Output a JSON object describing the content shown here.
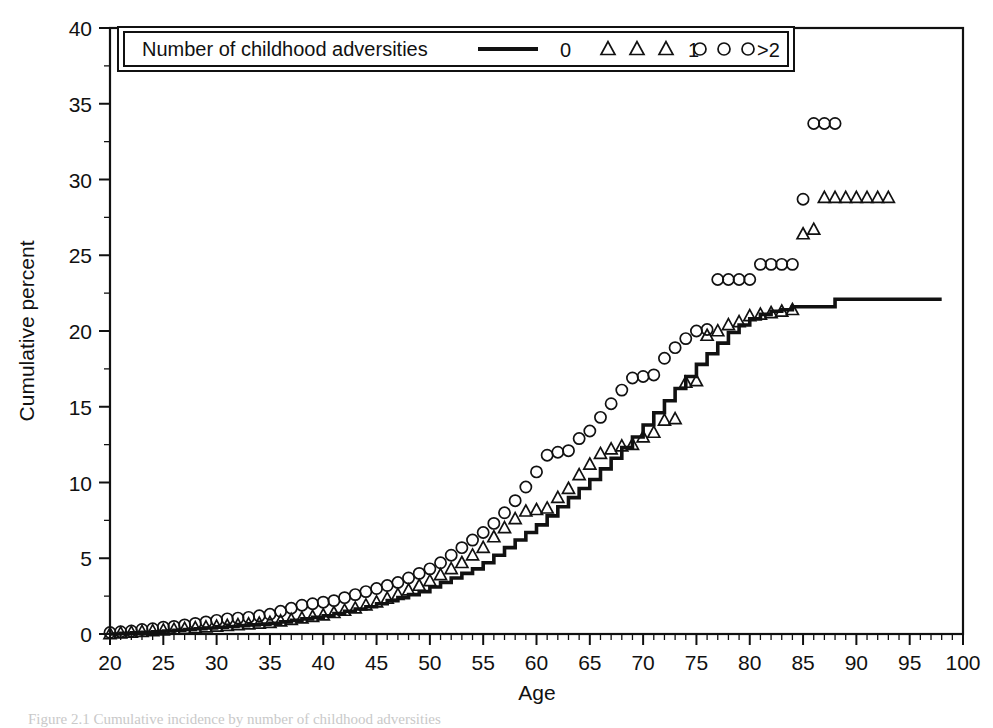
{
  "figure": {
    "caption_partial": "Figure 2.1  Cumulative incidence by number of childhood adversities"
  },
  "legend": {
    "title": "Number of childhood adversities",
    "entries": [
      {
        "label": "0",
        "marker": "line-icon"
      },
      {
        "label": "1",
        "marker": "triangle-icon"
      },
      {
        "label": ">2",
        "marker": "circle-icon"
      }
    ]
  },
  "chart_data": {
    "type": "line",
    "title": "",
    "subtitle": "",
    "xlabel": "Age",
    "ylabel": "Cumulative percent",
    "xlim": [
      20,
      100
    ],
    "ylim": [
      0,
      40
    ],
    "xticks": [
      20,
      25,
      30,
      35,
      40,
      45,
      50,
      55,
      60,
      65,
      70,
      75,
      80,
      85,
      90,
      95,
      100
    ],
    "yticks": [
      0,
      5,
      10,
      15,
      20,
      25,
      30,
      35,
      40
    ],
    "x_minor_step": 1,
    "y_minor_step": 2.5,
    "grid": false,
    "legend_position": "top-inside",
    "series": [
      {
        "name": "0",
        "legend_label": "0",
        "style": "step",
        "marker": "none",
        "x": [
          20,
          21,
          22,
          23,
          24,
          25,
          26,
          27,
          28,
          29,
          30,
          31,
          32,
          33,
          34,
          35,
          36,
          37,
          38,
          39,
          40,
          41,
          42,
          43,
          44,
          45,
          46,
          47,
          48,
          49,
          50,
          51,
          52,
          53,
          54,
          55,
          56,
          57,
          58,
          59,
          60,
          61,
          62,
          63,
          64,
          65,
          66,
          67,
          68,
          69,
          70,
          71,
          72,
          73,
          74,
          75,
          76,
          77,
          78,
          79,
          80,
          81,
          82,
          83,
          84,
          85,
          86,
          87,
          88,
          89,
          90,
          91,
          92,
          93,
          94,
          95,
          96,
          97,
          98
        ],
        "y": [
          0.0,
          0.05,
          0.08,
          0.12,
          0.15,
          0.2,
          0.25,
          0.3,
          0.35,
          0.4,
          0.45,
          0.5,
          0.55,
          0.6,
          0.65,
          0.7,
          0.8,
          0.9,
          1.0,
          1.1,
          1.2,
          1.35,
          1.5,
          1.65,
          1.8,
          2.0,
          2.2,
          2.4,
          2.6,
          2.8,
          3.1,
          3.4,
          3.7,
          4.0,
          4.3,
          4.7,
          5.2,
          5.7,
          6.2,
          6.7,
          7.2,
          7.8,
          8.4,
          9.0,
          9.6,
          10.2,
          10.9,
          11.6,
          12.3,
          13.0,
          13.8,
          14.6,
          15.4,
          16.2,
          17.0,
          17.8,
          18.5,
          19.2,
          19.9,
          20.4,
          20.8,
          21.1,
          21.3,
          21.4,
          21.6,
          21.6,
          21.6,
          21.6,
          22.1,
          22.1,
          22.1,
          22.1,
          22.1,
          22.1,
          22.1,
          22.1,
          22.1,
          22.1,
          22.1
        ]
      },
      {
        "name": "1",
        "legend_label": "1",
        "style": "markers",
        "marker": "triangle",
        "x": [
          20,
          21,
          22,
          23,
          24,
          25,
          26,
          27,
          28,
          29,
          30,
          31,
          32,
          33,
          34,
          35,
          36,
          37,
          38,
          39,
          40,
          41,
          42,
          43,
          44,
          45,
          46,
          47,
          48,
          49,
          50,
          51,
          52,
          53,
          54,
          55,
          56,
          57,
          58,
          59,
          60,
          61,
          62,
          63,
          64,
          65,
          66,
          67,
          68,
          69,
          70,
          71,
          72,
          73,
          74,
          75,
          76,
          77,
          78,
          79,
          80,
          81,
          82,
          83,
          84,
          85,
          86,
          87,
          88,
          89,
          90,
          91,
          92,
          93
        ],
        "y": [
          0.0,
          0.05,
          0.1,
          0.15,
          0.2,
          0.25,
          0.3,
          0.35,
          0.4,
          0.45,
          0.5,
          0.55,
          0.6,
          0.65,
          0.7,
          0.75,
          0.85,
          0.95,
          1.05,
          1.15,
          1.25,
          1.4,
          1.55,
          1.7,
          1.9,
          2.1,
          2.35,
          2.6,
          2.9,
          3.2,
          3.5,
          3.9,
          4.3,
          4.7,
          5.2,
          5.7,
          6.4,
          7.0,
          7.6,
          8.1,
          8.2,
          8.3,
          9.0,
          9.6,
          10.5,
          11.2,
          11.9,
          12.2,
          12.4,
          12.5,
          13.0,
          13.3,
          14.1,
          14.2,
          16.6,
          16.7,
          19.7,
          20.0,
          20.4,
          20.6,
          21.0,
          21.1,
          21.2,
          21.3,
          21.4,
          26.4,
          26.7,
          28.8,
          28.8,
          28.8,
          28.8,
          28.8,
          28.8,
          28.8
        ]
      },
      {
        "name": ">2",
        "legend_label": ">2",
        "style": "markers",
        "marker": "circle",
        "x": [
          20,
          21,
          22,
          23,
          24,
          25,
          26,
          27,
          28,
          29,
          30,
          31,
          32,
          33,
          34,
          35,
          36,
          37,
          38,
          39,
          40,
          41,
          42,
          43,
          44,
          45,
          46,
          47,
          48,
          49,
          50,
          51,
          52,
          53,
          54,
          55,
          56,
          57,
          58,
          59,
          60,
          61,
          62,
          63,
          64,
          65,
          66,
          67,
          68,
          69,
          70,
          71,
          72,
          73,
          74,
          75,
          76,
          77,
          78,
          79,
          80,
          81,
          82,
          83,
          84,
          85,
          86,
          87,
          88
        ],
        "y": [
          0.1,
          0.15,
          0.2,
          0.3,
          0.35,
          0.45,
          0.5,
          0.6,
          0.7,
          0.8,
          0.9,
          1.0,
          1.05,
          1.1,
          1.2,
          1.3,
          1.5,
          1.7,
          1.9,
          2.0,
          2.1,
          2.2,
          2.4,
          2.6,
          2.8,
          3.0,
          3.2,
          3.4,
          3.7,
          4.0,
          4.3,
          4.7,
          5.2,
          5.7,
          6.2,
          6.7,
          7.3,
          8.0,
          8.8,
          9.7,
          10.7,
          11.8,
          12.0,
          12.1,
          12.9,
          13.4,
          14.3,
          15.2,
          16.1,
          16.9,
          17.0,
          17.1,
          18.2,
          18.9,
          19.5,
          20.0,
          20.1,
          23.4,
          23.4,
          23.4,
          23.4,
          24.4,
          24.4,
          24.4,
          24.4,
          28.7,
          33.7,
          33.7,
          33.7
        ]
      }
    ]
  }
}
